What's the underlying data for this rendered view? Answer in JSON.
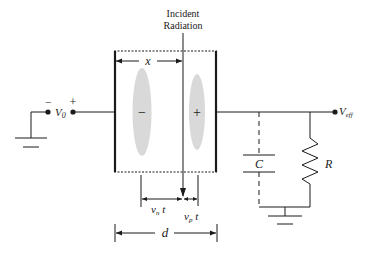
{
  "diagram": {
    "labels": {
      "incident_line1": "Incident",
      "incident_line2": "Radiation",
      "x": "x",
      "v0": "V",
      "v0_sub": "0",
      "v0_minus": "−",
      "v0_plus": "+",
      "veff": "V",
      "veff_sub": "eff",
      "minus_charge": "−",
      "plus_charge": "+",
      "C": "C",
      "R": "R",
      "vn": "v",
      "vn_sub": "n",
      "vn_t": " t",
      "vp": "v",
      "vp_sub": "p",
      "vp_t": " t",
      "d": "d"
    },
    "colors": {
      "line": "#1a1a1a",
      "charge_cloud": "#d9d9d9"
    }
  }
}
